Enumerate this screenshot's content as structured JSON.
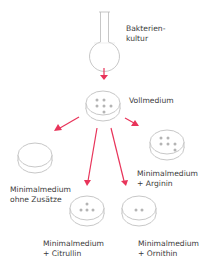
{
  "diagram": {
    "colors": {
      "arrow": "#e8345a",
      "outline": "#b9b9b9",
      "colony": "#b4b4b4",
      "text": "#3a3a3a"
    },
    "flask": {
      "label_line1": "Bakterien-",
      "label_line2": "kultur"
    },
    "plates": [
      {
        "id": "vollmedium",
        "label_line1": "Vollmedium",
        "label_line2": "",
        "colonies": 7
      },
      {
        "id": "ohne-zusaetze",
        "label_line1": "Minimalmedium",
        "label_line2": "ohne Zusätze",
        "colonies": 0
      },
      {
        "id": "arginin",
        "label_line1": "Minimalmedium",
        "label_line2": "+ Arginin",
        "colonies": 6
      },
      {
        "id": "citrullin",
        "label_line1": "Minimalmedium",
        "label_line2": "+ Citrullin",
        "colonies": 4
      },
      {
        "id": "ornithin",
        "label_line1": "Minimalmedium",
        "label_line2": "+ Ornithin",
        "colonies": 2
      }
    ]
  }
}
